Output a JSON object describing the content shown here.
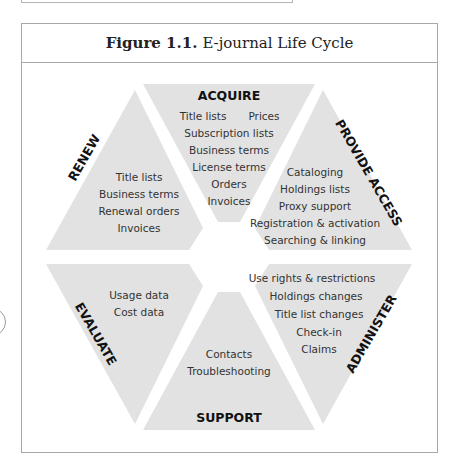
{
  "figure": {
    "caption_number": "Figure 1.1.",
    "caption_title": "E-journal Life Cycle"
  },
  "colors": {
    "segment_fill": "#e2e2e2",
    "frame_border": "#a8a8a8",
    "label_color": "#111111",
    "item_color": "#333333"
  },
  "segments": {
    "acquire": {
      "label": "ACQUIRE",
      "items": [
        "Title lists",
        "Prices",
        "Subscription lists",
        "Business terms",
        "License terms",
        "Orders",
        "Invoices"
      ]
    },
    "provide_access": {
      "label": "PROVIDE ACCESS",
      "items": [
        "Cataloging",
        "Holdings lists",
        "Proxy support",
        "Registration & activation",
        "Searching & linking"
      ]
    },
    "administer": {
      "label": "ADMINISTER",
      "items": [
        "Use rights & restrictions",
        "Holdings changes",
        "Title list changes",
        "Check-in",
        "Claims"
      ]
    },
    "support": {
      "label": "SUPPORT",
      "items": [
        "Contacts",
        "Troubleshooting"
      ]
    },
    "evaluate": {
      "label": "EVALUATE",
      "items": [
        "Usage data",
        "Cost data"
      ]
    },
    "renew": {
      "label": "RENEW",
      "items": [
        "Title lists",
        "Business terms",
        "Renewal orders",
        "Invoices"
      ]
    }
  }
}
